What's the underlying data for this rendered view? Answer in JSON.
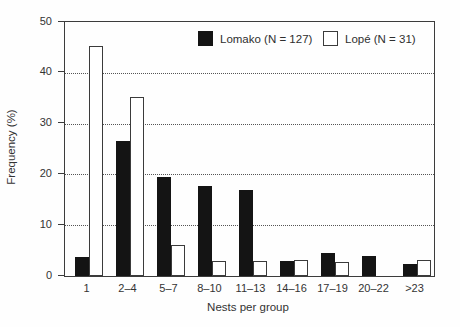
{
  "chart_data": {
    "type": "bar",
    "title": "",
    "xlabel": "Nests per group",
    "ylabel": "Frequency (%)",
    "ylim": [
      0,
      50
    ],
    "yticks": [
      0,
      10,
      20,
      30,
      40,
      50
    ],
    "gridlines": [
      10,
      20,
      30,
      40
    ],
    "grid_style": "dotted",
    "legend_position": "top-inside",
    "categories": [
      "1",
      "2–4",
      "5–7",
      "8–10",
      "11–13",
      "14–16",
      "17–19",
      "20–22",
      ">23"
    ],
    "series": [
      {
        "key": "lomako",
        "name": "Lomako (N = 127)",
        "style": "filled",
        "color": "#141414",
        "values": [
          3.7,
          26.5,
          19.5,
          17.8,
          17.0,
          2.9,
          4.5,
          4.0,
          2.3
        ]
      },
      {
        "key": "lope",
        "name": "Lopé (N = 31)",
        "style": "open",
        "color": "#ffffff",
        "values": [
          45.2,
          35.3,
          6.2,
          2.9,
          2.9,
          3.2,
          2.8,
          0,
          3.1
        ]
      }
    ]
  }
}
